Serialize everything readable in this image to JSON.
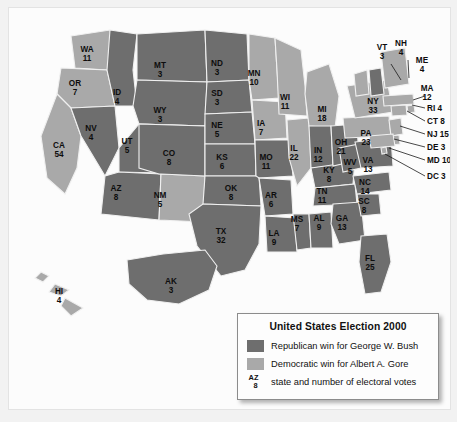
{
  "figure": {
    "name": "united-states-election-2000-electoral-map"
  },
  "legend": {
    "title": "United States Election 2000",
    "rows": [
      {
        "key": "republican",
        "label": "Republican win for George W. Bush",
        "color": "#6e6e6e"
      },
      {
        "key": "democratic",
        "label": "Democratic win for Albert A. Gore",
        "color": "#a9a9a9"
      }
    ],
    "sample": {
      "abbr": "AZ",
      "votes": "8",
      "label": "state and number of electoral votes"
    }
  },
  "colors": {
    "republican": "#6e6e6e",
    "democratic": "#a9a9a9",
    "border": "#f0f0f0",
    "water": "#fcfcfc",
    "text": "#0d0d0d"
  },
  "chart_data": {
    "type": "map",
    "title": "United States Election 2000",
    "states": [
      {
        "abbr": "WA",
        "votes": 11,
        "party": "democratic",
        "x": 78,
        "y": 44
      },
      {
        "abbr": "OR",
        "votes": 7,
        "party": "democratic",
        "x": 66,
        "y": 78
      },
      {
        "abbr": "CA",
        "votes": 54,
        "party": "democratic",
        "x": 50,
        "y": 140
      },
      {
        "abbr": "NV",
        "votes": 4,
        "party": "republican",
        "x": 82,
        "y": 123
      },
      {
        "abbr": "ID",
        "votes": 4,
        "party": "republican",
        "x": 108,
        "y": 87
      },
      {
        "abbr": "MT",
        "votes": 3,
        "party": "republican",
        "x": 151,
        "y": 60
      },
      {
        "abbr": "WY",
        "votes": 3,
        "party": "republican",
        "x": 151,
        "y": 105
      },
      {
        "abbr": "UT",
        "votes": 5,
        "party": "republican",
        "x": 118,
        "y": 136
      },
      {
        "abbr": "AZ",
        "votes": 8,
        "party": "republican",
        "x": 107,
        "y": 183
      },
      {
        "abbr": "NM",
        "votes": 5,
        "party": "democratic",
        "x": 151,
        "y": 190
      },
      {
        "abbr": "CO",
        "votes": 8,
        "party": "republican",
        "x": 160,
        "y": 148
      },
      {
        "abbr": "ND",
        "votes": 3,
        "party": "republican",
        "x": 208,
        "y": 58
      },
      {
        "abbr": "SD",
        "votes": 3,
        "party": "republican",
        "x": 208,
        "y": 88
      },
      {
        "abbr": "NE",
        "votes": 5,
        "party": "republican",
        "x": 208,
        "y": 120
      },
      {
        "abbr": "KS",
        "votes": 6,
        "party": "republican",
        "x": 213,
        "y": 152
      },
      {
        "abbr": "OK",
        "votes": 8,
        "party": "republican",
        "x": 222,
        "y": 183
      },
      {
        "abbr": "TX",
        "votes": 32,
        "party": "republican",
        "x": 212,
        "y": 226
      },
      {
        "abbr": "MN",
        "votes": 10,
        "party": "democratic",
        "x": 245,
        "y": 68
      },
      {
        "abbr": "IA",
        "votes": 7,
        "party": "democratic",
        "x": 252,
        "y": 118
      },
      {
        "abbr": "MO",
        "votes": 11,
        "party": "republican",
        "x": 257,
        "y": 152
      },
      {
        "abbr": "AR",
        "votes": 6,
        "party": "republican",
        "x": 262,
        "y": 190
      },
      {
        "abbr": "LA",
        "votes": 9,
        "party": "republican",
        "x": 265,
        "y": 228
      },
      {
        "abbr": "WI",
        "votes": 11,
        "party": "democratic",
        "x": 276,
        "y": 92
      },
      {
        "abbr": "IL",
        "votes": 22,
        "party": "democratic",
        "x": 285,
        "y": 143
      },
      {
        "abbr": "MS",
        "votes": 7,
        "party": "republican",
        "x": 288,
        "y": 214
      },
      {
        "abbr": "AL",
        "votes": 9,
        "party": "republican",
        "x": 310,
        "y": 213
      },
      {
        "abbr": "MI",
        "votes": 18,
        "party": "democratic",
        "x": 313,
        "y": 104
      },
      {
        "abbr": "IN",
        "votes": 12,
        "party": "republican",
        "x": 309,
        "y": 145
      },
      {
        "abbr": "KY",
        "votes": 8,
        "party": "republican",
        "x": 320,
        "y": 165
      },
      {
        "abbr": "TN",
        "votes": 11,
        "party": "republican",
        "x": 313,
        "y": 186
      },
      {
        "abbr": "GA",
        "votes": 13,
        "party": "republican",
        "x": 333,
        "y": 213
      },
      {
        "abbr": "FL",
        "votes": 25,
        "party": "republican",
        "x": 361,
        "y": 253
      },
      {
        "abbr": "SC",
        "votes": 8,
        "party": "republican",
        "x": 355,
        "y": 196
      },
      {
        "abbr": "NC",
        "votes": 14,
        "party": "republican",
        "x": 356,
        "y": 177
      },
      {
        "abbr": "OH",
        "votes": 21,
        "party": "republican",
        "x": 332,
        "y": 137
      },
      {
        "abbr": "WV",
        "votes": 5,
        "party": "republican",
        "x": 341,
        "y": 157
      },
      {
        "abbr": "VA",
        "votes": 13,
        "party": "republican",
        "x": 359,
        "y": 155
      },
      {
        "abbr": "PA",
        "votes": 23,
        "party": "democratic",
        "x": 357,
        "y": 128
      },
      {
        "abbr": "NY",
        "votes": 33,
        "party": "democratic",
        "x": 364,
        "y": 96
      },
      {
        "abbr": "HI",
        "votes": 4,
        "party": "democratic",
        "x": 50,
        "y": 286
      },
      {
        "abbr": "AK",
        "votes": 3,
        "party": "republican",
        "x": 162,
        "y": 276
      }
    ],
    "callouts": [
      {
        "abbr": "VT",
        "votes": 3,
        "party": "democratic",
        "tx": 373,
        "ty": 42,
        "stacked": true,
        "lx1": 382,
        "ly1": 56,
        "lx2": 392,
        "ly2": 72
      },
      {
        "abbr": "NH",
        "votes": 4,
        "party": "republican",
        "tx": 392,
        "ty": 38,
        "stacked": true,
        "lx1": 399,
        "ly1": 52,
        "lx2": 400,
        "ly2": 70
      },
      {
        "abbr": "ME",
        "votes": 4,
        "party": "democratic",
        "tx": 413,
        "ty": 55,
        "stacked": true,
        "lx1": 0,
        "ly1": 0,
        "lx2": 0,
        "ly2": 0
      },
      {
        "abbr": "MA",
        "votes": 12,
        "party": "democratic",
        "tx": 418,
        "ty": 83,
        "stacked": true,
        "lx1": 416,
        "ly1": 88,
        "lx2": 404,
        "ly2": 92
      },
      {
        "abbr": "RI 4",
        "votes": 4,
        "party": "democratic",
        "tx": 418,
        "ty": 103,
        "stacked": false,
        "lx1": 416,
        "ly1": 100,
        "lx2": 403,
        "ly2": 97
      },
      {
        "abbr": "CT 8",
        "votes": 8,
        "party": "democratic",
        "tx": 418,
        "ty": 116,
        "stacked": false,
        "lx1": 416,
        "ly1": 113,
        "lx2": 398,
        "ly2": 103
      },
      {
        "abbr": "NJ 15",
        "votes": 15,
        "party": "democratic",
        "tx": 418,
        "ty": 129,
        "stacked": false,
        "lx1": 416,
        "ly1": 126,
        "lx2": 391,
        "ly2": 118
      },
      {
        "abbr": "DE 3",
        "votes": 3,
        "party": "democratic",
        "tx": 418,
        "ty": 142,
        "stacked": false,
        "lx1": 416,
        "ly1": 139,
        "lx2": 385,
        "ly2": 131
      },
      {
        "abbr": "MD 10",
        "votes": 10,
        "party": "democratic",
        "tx": 418,
        "ty": 155,
        "stacked": false,
        "lx1": 416,
        "ly1": 152,
        "lx2": 380,
        "ly2": 140
      },
      {
        "abbr": "DC 3",
        "votes": 3,
        "party": "democratic",
        "tx": 418,
        "ty": 171,
        "stacked": false,
        "lx1": 416,
        "ly1": 168,
        "lx2": 376,
        "ly2": 146
      }
    ]
  }
}
